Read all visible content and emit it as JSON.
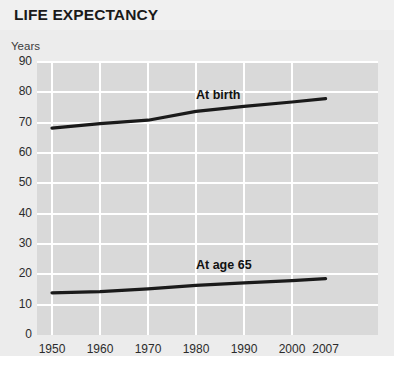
{
  "header": {
    "title": "LIFE EXPECTANCY"
  },
  "axes": {
    "y_unit_label": "Years",
    "y_ticks": [
      "90",
      "80",
      "70",
      "60",
      "50",
      "40",
      "30",
      "20",
      "10",
      "0"
    ],
    "x_ticks": [
      "1950",
      "1960",
      "1970",
      "1980",
      "1990",
      "2000",
      "2007"
    ]
  },
  "annotations": {
    "series_1_label": "At birth",
    "series_2_label": "At age 65"
  },
  "colors": {
    "plot_background": "#d9d9d9",
    "panel_background": "#ececec",
    "gridline": "#ffffff",
    "line": "#1a1a1a",
    "text": "#2b2b2b"
  },
  "chart_data": {
    "type": "line",
    "title": "LIFE EXPECTANCY",
    "xlabel": "",
    "ylabel": "Years",
    "xlim": [
      1950,
      2007
    ],
    "ylim": [
      0,
      90
    ],
    "ytick_step": 10,
    "grid": true,
    "legend": "inline-annotations",
    "x": [
      1950,
      1960,
      1970,
      1980,
      1990,
      2000,
      2007
    ],
    "series": [
      {
        "name": "At birth",
        "values": [
          68.2,
          69.7,
          70.8,
          73.7,
          75.4,
          76.8,
          77.9
        ]
      },
      {
        "name": "At age 65",
        "values": [
          13.9,
          14.3,
          15.2,
          16.4,
          17.2,
          17.9,
          18.6
        ]
      }
    ]
  }
}
